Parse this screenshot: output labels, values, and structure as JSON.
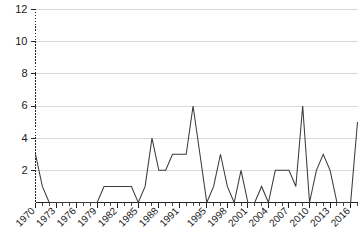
{
  "chart_data": {
    "type": "line",
    "title": "",
    "subtitle": "",
    "xlabel": "",
    "ylabel": "",
    "xlim": [
      1970,
      2017
    ],
    "ylim": [
      0,
      12
    ],
    "grid": true,
    "legend_position": "none",
    "y_ticks": [
      "2",
      "4",
      "6",
      "8",
      "10",
      "12"
    ],
    "y_tick_values": [
      2,
      4,
      6,
      8,
      10,
      12
    ],
    "y_minor_tick_step": 0.5,
    "x_ticks": [
      "1970",
      "1973",
      "1976",
      "1979",
      "1982",
      "1985",
      "1988",
      "1991",
      "1995",
      "1998",
      "2001",
      "2004",
      "2007",
      "2010",
      "2013",
      "2016"
    ],
    "x_tick_values": [
      1970,
      1973,
      1976,
      1979,
      1982,
      1985,
      1988,
      1991,
      1995,
      1998,
      2001,
      2004,
      2007,
      2010,
      2013,
      2016
    ],
    "x": [
      1970,
      1971,
      1972,
      1973,
      1974,
      1975,
      1976,
      1977,
      1978,
      1979,
      1980,
      1981,
      1982,
      1983,
      1984,
      1985,
      1986,
      1987,
      1988,
      1989,
      1990,
      1991,
      1992,
      1993,
      1994,
      1995,
      1996,
      1997,
      1998,
      1999,
      2000,
      2001,
      2002,
      2003,
      2004,
      2005,
      2006,
      2007,
      2008,
      2009,
      2010,
      2011,
      2012,
      2013,
      2014,
      2015,
      2016,
      2017
    ],
    "values": [
      3,
      1,
      0,
      0,
      0,
      0,
      0,
      0,
      0,
      0,
      1,
      1,
      1,
      1,
      1,
      0,
      1,
      4,
      2,
      2,
      3,
      3,
      3,
      6,
      3,
      0,
      1,
      3,
      1,
      0,
      2,
      0,
      0,
      1,
      0,
      2,
      2,
      2,
      1,
      6,
      0,
      2,
      3,
      2,
      0,
      0,
      0,
      5
    ],
    "series": [
      {
        "name": "count",
        "color": "#3b3b3b",
        "values": [
          3,
          1,
          0,
          0,
          0,
          0,
          0,
          0,
          0,
          0,
          1,
          1,
          1,
          1,
          1,
          0,
          1,
          4,
          2,
          2,
          3,
          3,
          3,
          6,
          3,
          0,
          1,
          3,
          1,
          0,
          2,
          0,
          0,
          1,
          0,
          2,
          2,
          2,
          1,
          6,
          0,
          2,
          3,
          2,
          0,
          0,
          0,
          5
        ]
      }
    ]
  },
  "colors": {
    "line": "#3b3b3b",
    "grid": "#cfcfcf",
    "axis": "#222222",
    "text": "#1a1a1a",
    "background": "#ffffff"
  }
}
